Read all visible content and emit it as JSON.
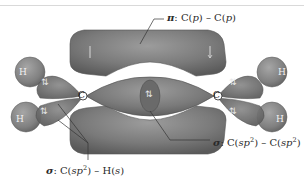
{
  "diagram": {
    "labels": {
      "pi_bond": {
        "symbol": "π",
        "prefix": ": C(",
        "orbital_a": "p",
        "middle": ") – C(",
        "orbital_b": "p",
        "suffix": ")"
      },
      "sigma_cc": {
        "symbol": "σ",
        "prefix": ": C(",
        "orbital_a": "sp",
        "sup_a": "2",
        "middle": ") – C(",
        "orbital_b": "sp",
        "sup_b": "2",
        "suffix": ")"
      },
      "sigma_ch": {
        "symbol": "σ",
        "prefix": ": C(",
        "orbital_a": "sp",
        "sup_a": "2",
        "middle": ") – H(",
        "orbital_b": "s",
        "suffix": ")"
      }
    },
    "atoms": {
      "carbon_left": "C",
      "carbon_right": "C",
      "hydrogens": [
        "H",
        "H",
        "H",
        "H"
      ]
    },
    "electron_pair_glyph": "⇅",
    "colors": {
      "lobe_fill": "#7a7a7a",
      "lobe_dark": "#5c5c5c",
      "lobe_light": "#9a9a9a",
      "hydrogen_fill": "#8a8a8a",
      "leader_line": "#333333",
      "background": "#ffffff"
    }
  }
}
